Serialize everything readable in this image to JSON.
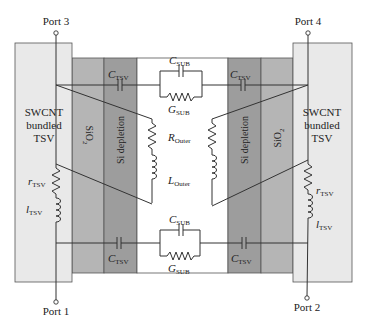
{
  "diagram": {
    "ports": {
      "port1": "Port 1",
      "port2": "Port 2",
      "port3": "Port 3",
      "port4": "Port 4"
    },
    "tsv_left": {
      "line1": "SWCNT",
      "line2": "bundled",
      "line3": "TSV"
    },
    "tsv_right": {
      "line1": "SWCNT",
      "line2": "bundled",
      "line3": "TSV"
    },
    "layers": {
      "sio2_left": "SiO",
      "sio2_right": "SiO",
      "sio2_sub": "2",
      "depletion_left": "Si depletion",
      "depletion_right": "Si depletion"
    },
    "components": {
      "c_tsv": {
        "main": "C",
        "sub": "TSV"
      },
      "c_sub": {
        "main": "C",
        "sub": "SUB"
      },
      "g_sub": {
        "main": "G",
        "sub": "SUB"
      },
      "r_outer": {
        "main": "R",
        "sub": "Outer"
      },
      "l_outer": {
        "main": "L",
        "sub": "Outer"
      },
      "r_tsv": {
        "main": "r",
        "sub": "TSV"
      },
      "l_tsv": {
        "main": "l",
        "sub": "TSV"
      }
    },
    "colors": {
      "tsv_fill": "#e9e9e9",
      "sio2_fill": "#b5b5b5",
      "depletion_fill": "#9d9d9d",
      "wire": "#333333"
    }
  }
}
